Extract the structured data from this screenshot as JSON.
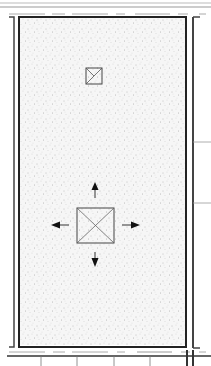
{
  "diagram": {
    "type": "floor-plan",
    "canvas": {
      "width": 211,
      "height": 366,
      "background": "#ffffff"
    },
    "colors": {
      "wall": "#333333",
      "thin_line": "#666666",
      "light_line": "#aaaaaa",
      "fill_stipple": "#f4f4f4",
      "dot": "#8a8a8a",
      "arrow": "#111111"
    },
    "room": {
      "label": "stippled-floor-area",
      "x": 19,
      "y": 17,
      "width": 167,
      "height": 329
    },
    "elements": [
      {
        "name": "small-square-marker",
        "x": 86,
        "y": 68,
        "size": 16,
        "diagonals": 1
      },
      {
        "name": "large-square-marker",
        "x": 77,
        "y": 208,
        "size": 37,
        "diagonals": 2
      }
    ],
    "arrows": [
      {
        "direction": "up",
        "x": 95,
        "y": 183
      },
      {
        "direction": "down",
        "x": 95,
        "y": 265
      },
      {
        "direction": "left",
        "x": 52,
        "y": 225
      },
      {
        "direction": "right",
        "x": 139,
        "y": 225
      }
    ]
  }
}
